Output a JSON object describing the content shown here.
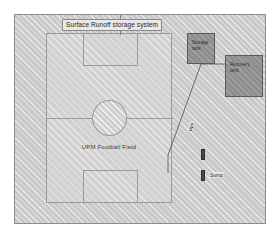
{
  "diagram": {
    "title": "Surface Runoff storage system",
    "field": {
      "label": "UPM Football Field"
    },
    "tanks": [
      {
        "id": "storage-tank",
        "label": "Storage\ntank"
      },
      {
        "id": "recovery-tank",
        "label": "Recovery\ntank"
      }
    ],
    "pipe": {
      "label": "pipe"
    },
    "sumps": [
      {
        "id": "sump-upper",
        "label": ""
      },
      {
        "id": "sump-lower",
        "label": "Sump"
      }
    ],
    "colors": {
      "ground_fill": "#c9c9c9",
      "field_fill": "#d2d2d2",
      "tank_fill": "#8e8e8e",
      "sump_fill": "#4a4a4a",
      "line": "#8a8a8a"
    }
  }
}
